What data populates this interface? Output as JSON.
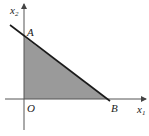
{
  "diagram": {
    "type": "feasible-region",
    "axes": {
      "x_label": "x",
      "x_sub": "1",
      "y_label": "x",
      "y_sub": "2",
      "origin_label": "O"
    },
    "points": [
      {
        "name": "A",
        "label": "A"
      },
      {
        "name": "B",
        "label": "B"
      },
      {
        "name": "O",
        "label": "O"
      }
    ],
    "region": {
      "vertices": [
        "O",
        "A",
        "B"
      ],
      "fill": "#9a9a9a"
    },
    "line": {
      "through": [
        "A",
        "B"
      ],
      "color": "#1a1a1a"
    }
  },
  "labels": {
    "A": "A",
    "B": "B",
    "O": "O"
  }
}
